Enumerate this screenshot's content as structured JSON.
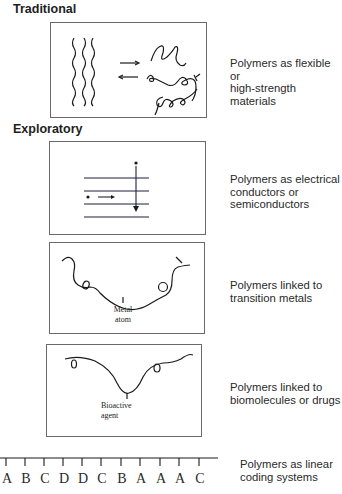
{
  "sections": {
    "traditional": "Traditional",
    "exploratory": "Exploratory"
  },
  "panels": [
    {
      "id": "flexible",
      "caption": "Polymers as flexible or\nhigh-strength materials"
    },
    {
      "id": "conductors",
      "caption": "Polymers as electrical\nconductors or\nsemiconductors"
    },
    {
      "id": "metals",
      "caption": "Polymers linked to\ntransition metals",
      "label": "Metal\natom"
    },
    {
      "id": "biomolecules",
      "caption": "Polymers linked to\nbiomolecules or drugs",
      "label": "Bioactive\nagent"
    }
  ],
  "coding": {
    "caption": "Polymers as linear\ncoding systems",
    "sequence": [
      "A",
      "B",
      "C",
      "D",
      "D",
      "C",
      "B",
      "A",
      "A",
      "A",
      "C"
    ]
  },
  "colors": {
    "line": "#1a1a1a",
    "band_line": "#1f1f5a",
    "border": "#6a6a6a"
  }
}
